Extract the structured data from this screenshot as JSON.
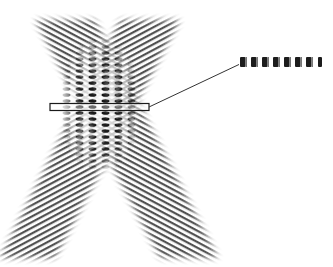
{
  "diagram": {
    "beams": [
      {
        "name": "left-beam",
        "from": [
          20,
          260
        ],
        "to": [
          175,
          15
        ],
        "fringe_angle_deg": 28
      },
      {
        "name": "right-beam",
        "from": [
          215,
          260
        ],
        "to": [
          40,
          15
        ],
        "fringe_angle_deg": -28
      }
    ],
    "interference_region": {
      "center": [
        100,
        105
      ],
      "columns": 7,
      "rows": 13
    },
    "slice_box": {
      "x": 50,
      "y": 103,
      "width": 99,
      "height": 7
    },
    "pointer_line": {
      "from": [
        149,
        107
      ],
      "to": [
        240,
        64
      ]
    },
    "magnified_strip": {
      "x": 239,
      "y": 57,
      "width": 87,
      "height": 10,
      "fringe_count": 8
    },
    "colors": {
      "ink": "#1a1a1a",
      "fringe": "#3a3a3a",
      "background": "#ffffff"
    }
  }
}
